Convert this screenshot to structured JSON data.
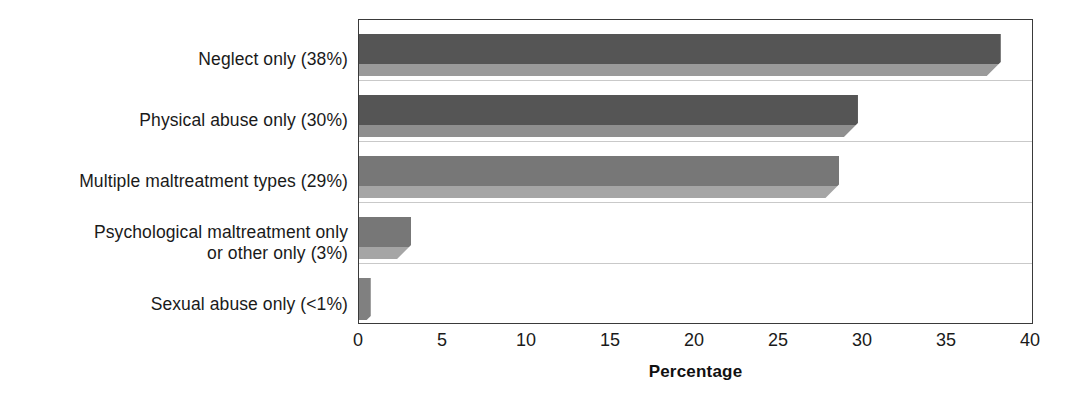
{
  "chart_data": {
    "type": "bar",
    "orientation": "horizontal",
    "title": "",
    "xlabel": "Percentage",
    "ylabel": "",
    "xlim": [
      0,
      40
    ],
    "xticks": [
      0,
      5,
      10,
      15,
      20,
      25,
      30,
      35,
      40
    ],
    "xtick_labels": [
      "0",
      "5",
      "10",
      "15",
      "20",
      "25",
      "30",
      "35",
      "40"
    ],
    "grid": true,
    "legend": "none",
    "categories": [
      "Neglect only (38%)",
      "Physical abuse only (30%)",
      "Multiple maltreatment types (29%)",
      "Psychological maltreatment only\nor other only (3%)",
      "Sexual abuse only (<1%)"
    ],
    "values": [
      38.2,
      29.7,
      28.6,
      3.1,
      0.7
    ],
    "value_labels": [
      "38%",
      "30%",
      "29%",
      "3%",
      "<1%"
    ],
    "bar_colors": [
      "#555555",
      "#555555",
      "#777777",
      "#777777",
      "#808080"
    ],
    "bar_bevel_colors": [
      "#9a9a9a",
      "#8f8f8f",
      "#a5a5a5",
      "#a5a5a5",
      "#808080"
    ]
  },
  "axis": {
    "frame_color": "#3a3a3a",
    "gridline_color": "#c9c9c9"
  }
}
